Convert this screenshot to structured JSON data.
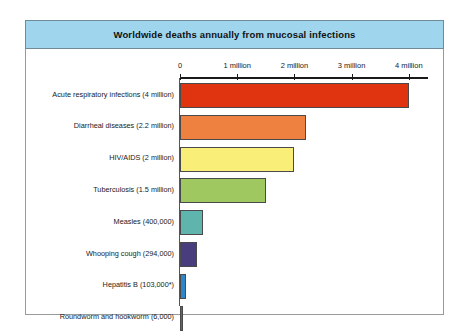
{
  "title": "Worldwide deaths annually from mucosal infections",
  "colors": {
    "title_band": "#9fd6ee",
    "frame_border": "#9a9a9a",
    "axis": "#1a1a1a"
  },
  "chart_data": {
    "type": "bar",
    "orientation": "horizontal",
    "title": "Worldwide deaths annually from mucosal infections",
    "xlabel": "",
    "ylabel": "",
    "xlim": [
      0,
      4.35
    ],
    "grid": false,
    "legend": null,
    "axis_unit": "million deaths per year",
    "tick_values": [
      0,
      1,
      2,
      3,
      4
    ],
    "tick_labels": [
      "0",
      "1 million",
      "2 million",
      "3 million",
      "4 million"
    ],
    "footnote": "* asterisk on Hepatitis B value",
    "categories": [
      "Acute respiratory infections (4 million)",
      "Diarrheal diseases (2.2 million)",
      "HIV/AIDS (2 million)",
      "Tuberculosis (1.5 million)",
      "Measles (400,000)",
      "Whooping cough (294,000)",
      "Hepatitis B (103,000*)",
      "Roundworm and hookworm (6,000)"
    ],
    "values": [
      4.0,
      2.2,
      2.0,
      1.5,
      0.4,
      0.294,
      0.103,
      0.006
    ],
    "value_labels": [
      "4 million",
      "2.2 million",
      "2 million",
      "1.5 million",
      "400,000",
      "294,000",
      "103,000*",
      "6,000"
    ],
    "bar_colors": [
      "#e03411",
      "#ee8040",
      "#f9ee77",
      "#9fc861",
      "#5fb5ae",
      "#4a3d7e",
      "#2e86c8",
      "#8b5a3c"
    ]
  }
}
